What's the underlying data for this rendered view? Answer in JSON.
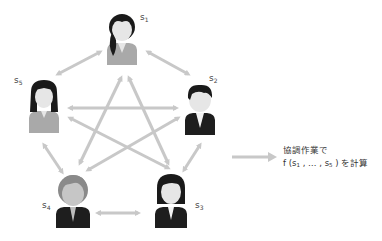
{
  "diagram": {
    "participants": [
      {
        "id": "s1",
        "label": "s",
        "sub": "1",
        "role": "woman-ponytail"
      },
      {
        "id": "s2",
        "label": "s",
        "sub": "2",
        "role": "man-black-hair"
      },
      {
        "id": "s3",
        "label": "s",
        "sub": "3",
        "role": "woman-bob"
      },
      {
        "id": "s4",
        "label": "s",
        "sub": "4",
        "role": "man-gray-hair"
      },
      {
        "id": "s5",
        "label": "s",
        "sub": "5",
        "role": "woman-long-hair"
      }
    ],
    "connections": "all-pairs bidirectional",
    "caption": {
      "line1": "協調作業で",
      "line2_prefix": "f (s",
      "line2_sub1": "1",
      "line2_mid": " , … , s",
      "line2_sub2": "5",
      "line2_suffix": " ) を計算"
    },
    "colors": {
      "arrow": "#c8c8c8",
      "hair_dark": "#1a1a1a",
      "hair_gray": "#8a8a8a",
      "skin": "#e6e6e6",
      "suit_dark": "#1e1e1e",
      "suit_gray": "#a9a9a9"
    }
  }
}
